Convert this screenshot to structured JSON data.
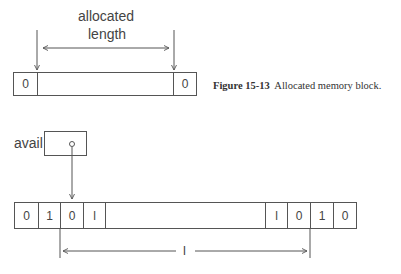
{
  "figure_top": {
    "annotation_line1": "allocated",
    "annotation_line2": "length",
    "block_cells": [
      "0",
      "",
      "0"
    ],
    "caption_number": "Figure 15-13",
    "caption_text": "Allocated memory block."
  },
  "figure_bottom": {
    "pointer_label": "avail",
    "block_cells": [
      "0",
      "1",
      "0",
      "l",
      "",
      "l",
      "0",
      "1",
      "0"
    ],
    "length_label": "l"
  }
}
